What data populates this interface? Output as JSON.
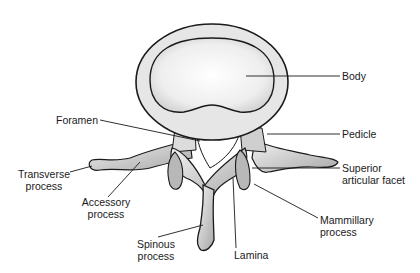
{
  "diagram": {
    "labels": {
      "body": "Body",
      "foramen": "Foramen",
      "pedicle": "Pedicle",
      "transverse_1": "Transverse",
      "transverse_2": "process",
      "superior_1": "Superior",
      "superior_2": "articular facet",
      "accessory_1": "Accessory",
      "accessory_2": "process",
      "mammillary_1": "Mammillary",
      "mammillary_2": "process",
      "spinous_1": "Spinous",
      "spinous_2": "process",
      "lamina": "Lamina"
    },
    "colors": {
      "ink": "#1a1a1a",
      "bone": "#e8e8e8",
      "shade": "#9a9a9a",
      "background": "#ffffff"
    }
  }
}
